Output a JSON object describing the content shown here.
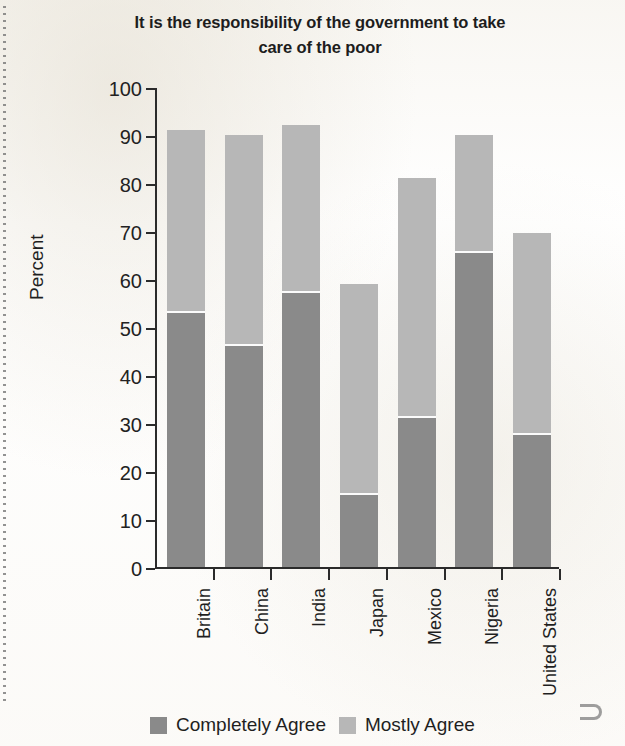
{
  "chart_data": {
    "type": "bar",
    "subtype": "stacked-vertical",
    "title": "It is the responsibility of the government to take care of the poor",
    "xlabel": "",
    "ylabel": "Percent",
    "ylim": [
      0,
      100
    ],
    "yticks": [
      0,
      10,
      20,
      30,
      40,
      50,
      60,
      70,
      80,
      90,
      100
    ],
    "grid": false,
    "legend_position": "bottom",
    "categories": [
      "Britain",
      "China",
      "India",
      "Japan",
      "Mexico",
      "Nigeria",
      "United States"
    ],
    "series": [
      {
        "name": "Completely Agree",
        "color": "#8a8a8a",
        "values": [
          53,
          46,
          57,
          15,
          31,
          65.5,
          27.5
        ]
      },
      {
        "name": "Mostly Agree",
        "color": "#b7b7b7",
        "values": [
          38,
          44,
          35,
          44,
          50,
          24.5,
          42
        ]
      }
    ],
    "stack_totals": [
      91,
      90,
      92,
      59,
      81,
      90,
      69.5
    ]
  },
  "legend": {
    "items": [
      {
        "label": "Completely Agree",
        "swatch": "dark"
      },
      {
        "label": "Mostly Agree",
        "swatch": "light"
      }
    ]
  }
}
